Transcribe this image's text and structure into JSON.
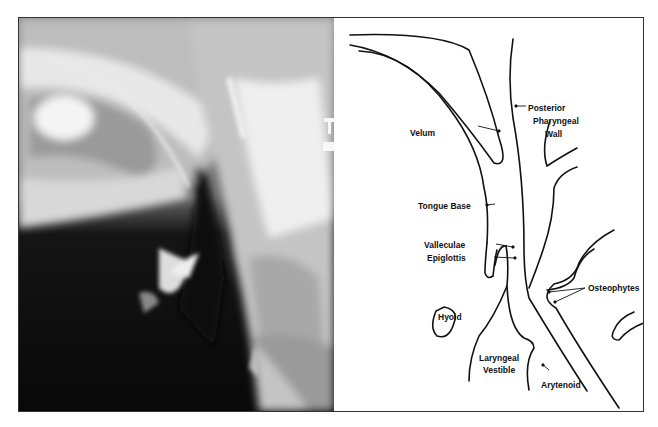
{
  "figure": {
    "panels": [
      {
        "type": "radiograph",
        "description": "lateral neck x-ray"
      },
      {
        "type": "line-drawing",
        "description": "labeled tracing of pharyngeal anatomy"
      }
    ],
    "labels": {
      "posterior": "Posterior",
      "pharyngeal": "Pharyngeal",
      "wall": "Wall",
      "velum": "Velum",
      "tongue_base": "Tongue Base",
      "valleculae": "Valleculae",
      "epiglottis": "Epiglottis",
      "osteophytes": "Osteophytes",
      "hyoid": "Hyoid",
      "laryngeal": "Laryngeal",
      "vestible": "Vestible",
      "arytenoid": "Arytenoid"
    },
    "colors": {
      "line": "#111111",
      "border": "#333333",
      "background": "#ffffff"
    }
  }
}
